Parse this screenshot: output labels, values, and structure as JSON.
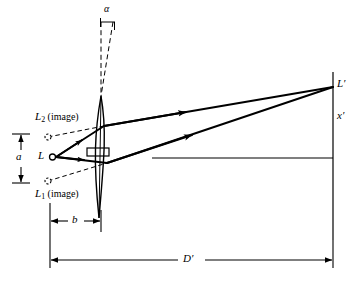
{
  "figure": {
    "type": "optical-ray-diagram",
    "labels": {
      "alpha": "α",
      "source": "L",
      "image_upper": "L",
      "image_upper_sub": "2",
      "image_upper_note": "(image)",
      "image_lower": "L",
      "image_lower_sub": "1",
      "image_lower_note": "(image)",
      "image_point": "L′",
      "screen_height": "x′",
      "dim_a": "a",
      "dim_b": "b",
      "dim_d": "D′"
    },
    "colors": {
      "ink": "#000000",
      "background": "#ffffff"
    },
    "geometry": {
      "source_point": [
        52,
        157
      ],
      "lens_apex_top": [
        101,
        96
      ],
      "lens_apex_bottom": [
        101,
        218
      ],
      "lens_center": [
        99,
        157
      ],
      "image_point": [
        333,
        87
      ],
      "screen_x": 333,
      "axis_y": 158,
      "axis_start_x": 152,
      "virtual_image_upper": [
        50,
        137
      ],
      "virtual_image_lower": [
        50,
        180
      ],
      "dim_b_from": 50,
      "dim_b_to": 101,
      "dim_d_from": 50,
      "dim_d_to": 333,
      "dim_a_top": 134,
      "dim_a_bottom": 183
    }
  }
}
